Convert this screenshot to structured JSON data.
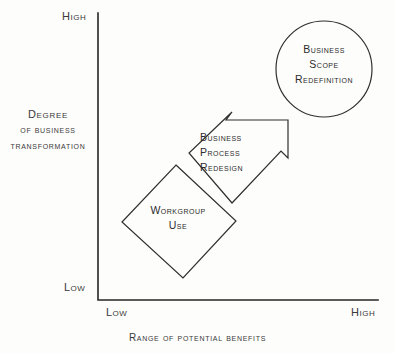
{
  "figure": {
    "type": "diagram",
    "kind": "2x2-positioning-diagram",
    "background_color": "#fdfdfb",
    "stroke_color": "#2f2f2f"
  },
  "axes": {
    "y": {
      "title_line1": "Degree",
      "title_line2": "of business",
      "title_line3": "transformation",
      "high_label": "High",
      "low_label": "Low"
    },
    "x": {
      "title": "Range of potential benefits",
      "low_label": "Low",
      "high_label": "High"
    }
  },
  "nodes": [
    {
      "id": "workgroup-use",
      "shape": "diamond",
      "line1": "Workgroup",
      "line2": "Use",
      "position": "low-benefit / low-transformation"
    },
    {
      "id": "business-process-redesign",
      "shape": "arrow",
      "line1": "Business",
      "line2": "Process",
      "line3": "Redesign",
      "position": "mid-benefit / mid-transformation"
    },
    {
      "id": "business-scope-redefinition",
      "shape": "circle",
      "line1": "Business",
      "line2": "Scope",
      "line3": "Redefinition",
      "position": "high-benefit / high-transformation"
    }
  ]
}
